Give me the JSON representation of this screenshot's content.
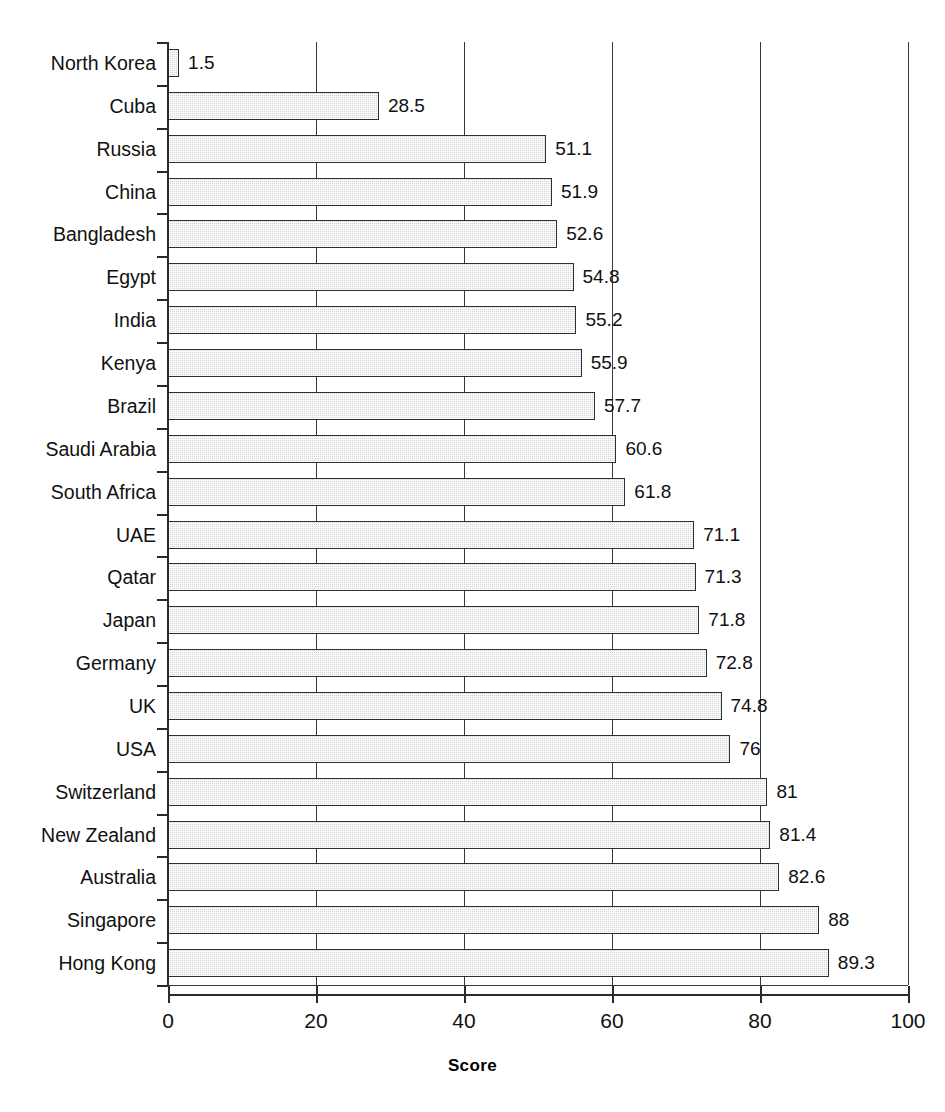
{
  "chart_data": {
    "type": "bar",
    "orientation": "horizontal",
    "title": "",
    "xlabel": "Score",
    "ylabel": "",
    "xlim": [
      0,
      100
    ],
    "xticks": [
      0,
      20,
      40,
      60,
      80,
      100
    ],
    "xtick_labels": [
      "0",
      "20",
      "40",
      "60",
      "80",
      "100"
    ],
    "grid": true,
    "grid_axis": "x",
    "legend": false,
    "bar_color": "#d6d6d6",
    "bar_border_color": "#2f2f2f",
    "categories": [
      "North Korea",
      "Cuba",
      "Russia",
      "China",
      "Bangladesh",
      "Egypt",
      "India",
      "Kenya",
      "Brazil",
      "Saudi Arabia",
      "South Africa",
      "UAE",
      "Qatar",
      "Japan",
      "Germany",
      "UK",
      "USA",
      "Switzerland",
      "New Zealand",
      "Australia",
      "Singapore",
      "Hong Kong"
    ],
    "values": [
      1.5,
      28.5,
      51.1,
      51.9,
      52.6,
      54.8,
      55.2,
      55.9,
      57.7,
      60.6,
      61.8,
      71.1,
      71.3,
      71.8,
      72.8,
      74.8,
      76,
      81,
      81.4,
      82.6,
      88,
      89.3
    ],
    "value_labels": [
      "1.5",
      "28.5",
      "51.1",
      "51.9",
      "52.6",
      "54.8",
      "55.2",
      "55.9",
      "57.7",
      "60.6",
      "61.8",
      "71.1",
      "71.3",
      "71.8",
      "72.8",
      "74.8",
      "76",
      "81",
      "81.4",
      "82.6",
      "88",
      "89.3"
    ]
  }
}
